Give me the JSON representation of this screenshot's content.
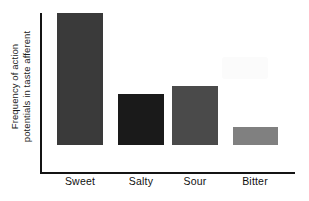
{
  "chart_data": {
    "type": "bar",
    "title": "",
    "subtitle": "",
    "xlabel": "",
    "ylabel": "Frequency of action potentials in taste afferent",
    "ylabel_lines": [
      "Frequency of action",
      "potentials in taste afferent"
    ],
    "categories": [
      "Sweet",
      "Salty",
      "Sour",
      "Bitter"
    ],
    "values": [
      100,
      39,
      45,
      13
    ],
    "ylim": [
      0,
      122
    ],
    "grid": false,
    "legend": false,
    "axis_ticks_shown": false,
    "bar_colors": [
      "#3a3a3a",
      "#1a1a1a",
      "#4a4a4a",
      "#808080"
    ],
    "bars": [
      {
        "label": "Sweet",
        "value": 100,
        "color": "#3a3a3a",
        "left": 57,
        "width": 46,
        "height": 132
      },
      {
        "label": "Salty",
        "value": 39,
        "color": "#1a1a1a",
        "left": 118,
        "width": 46,
        "height": 51
      },
      {
        "label": "Sour",
        "value": 45,
        "color": "#4a4a4a",
        "left": 172,
        "width": 46,
        "height": 59
      },
      {
        "label": "Bitter",
        "value": 13,
        "color": "#808080",
        "left": 233,
        "width": 45,
        "height": 18
      }
    ],
    "tick_label_centers": [
      80,
      141,
      195,
      255
    ]
  },
  "colors": {
    "background": "#ffffff",
    "axis": "#141414",
    "text": "#111111"
  }
}
